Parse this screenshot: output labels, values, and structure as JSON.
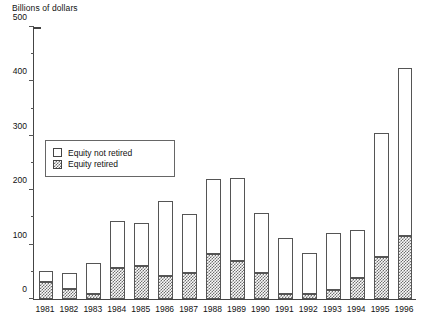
{
  "chart_data": {
    "type": "bar",
    "title": "",
    "subtitle": "",
    "ylabel": "Billions of dollars",
    "xlabel": "",
    "ylim": [
      0,
      500
    ],
    "ytick_step": 100,
    "yminor_step": 50,
    "grid": false,
    "stacked": true,
    "legend_position": "inside-upper-left",
    "ytick_labels": [
      "0",
      "100",
      "200",
      "300",
      "400",
      "500"
    ],
    "categories": [
      "1981",
      "1982",
      "1983",
      "1984",
      "1985",
      "1986",
      "1987",
      "1988",
      "1989",
      "1990",
      "1991",
      "1992",
      "1993",
      "1994",
      "1995",
      "1996"
    ],
    "series": [
      {
        "name": "Equity retired",
        "pattern": "checkerboard-hatch",
        "color": "#6f6f6f",
        "values": [
          31,
          18,
          10,
          57,
          60,
          43,
          47,
          82,
          70,
          48,
          10,
          10,
          16,
          38,
          78,
          115
        ]
      },
      {
        "name": "Equity not retired",
        "pattern": "open",
        "color": "#ffffff",
        "values": [
          20,
          29,
          57,
          87,
          79,
          137,
          109,
          139,
          153,
          110,
          103,
          75,
          106,
          89,
          227,
          310
        ]
      }
    ],
    "totals": [
      51,
      47,
      67,
      144,
      139,
      180,
      156,
      221,
      223,
      158,
      113,
      85,
      122,
      127,
      305,
      425
    ]
  },
  "legend": {
    "items": [
      {
        "label": "Equity not retired",
        "style": "open"
      },
      {
        "label": "Equity retired",
        "style": "hatch"
      }
    ]
  }
}
